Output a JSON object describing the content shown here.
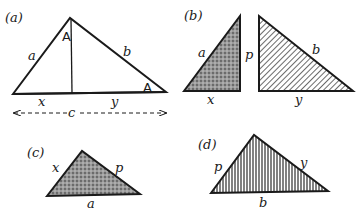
{
  "panels": {
    "a": {
      "tag": "(a)",
      "angle_top": "A",
      "angle_right": "A",
      "side_left": "a",
      "side_right": "b",
      "base_left": "x",
      "base_right": "y",
      "hypotenuse_length": "c"
    },
    "b": {
      "tag": "(b)",
      "left_hyp": "a",
      "left_height": "p",
      "left_base": "x",
      "right_hyp": "b",
      "right_base": "y"
    },
    "c": {
      "tag": "(c)",
      "side_left": "x",
      "side_right": "p",
      "base": "a"
    },
    "d": {
      "tag": "(d)",
      "side_left": "p",
      "side_right": "y",
      "base": "b"
    }
  },
  "colors": {
    "ink": "#1a1a1a",
    "stipple": "#8a8a8a"
  }
}
